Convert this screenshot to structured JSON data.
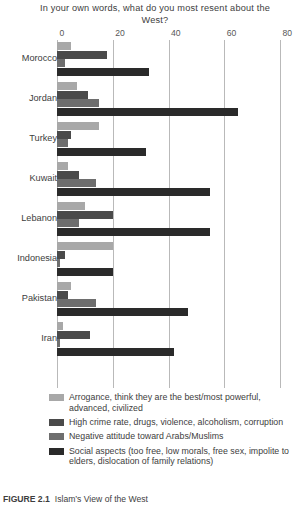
{
  "chart_data": {
    "type": "bar",
    "orientation": "horizontal",
    "title": "In your own words, what do you most resent about the West?",
    "xlabel": "",
    "ylabel": "",
    "xlim": [
      0,
      80
    ],
    "xticks": [
      0,
      20,
      40,
      60,
      80
    ],
    "grid": true,
    "legend_position": "bottom",
    "categories": [
      "Morocco",
      "Jordan",
      "Turkey",
      "Kuwait",
      "Lebanon",
      "Indonesia",
      "Pakistan",
      "Iran"
    ],
    "series": [
      {
        "name": "Arrogance, think they are the best/most powerful, advanced, civilized",
        "color": "#a8a8a8",
        "values": [
          5,
          7,
          15,
          4,
          10,
          20,
          5,
          2
        ]
      },
      {
        "name": "High crime rate, drugs, violence, alcoholism, corruption",
        "color": "#4a4a4a",
        "values": [
          18,
          11,
          5,
          8,
          20,
          3,
          4,
          12
        ]
      },
      {
        "name": "Negative attitude toward Arabs/Muslims",
        "color": "#6e6e6e",
        "values": [
          3,
          15,
          4,
          14,
          8,
          1,
          14,
          1
        ]
      },
      {
        "name": "Social aspects (too free, low morals, free sex, impolite to elders, dislocation of family relations)",
        "color": "#2a2a2a",
        "values": [
          33,
          65,
          32,
          55,
          55,
          20,
          47,
          42
        ]
      }
    ]
  },
  "caption": {
    "label": "FIGURE 2.1",
    "text": "Islam’s View of the West"
  }
}
